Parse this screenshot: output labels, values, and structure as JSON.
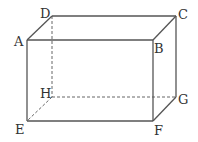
{
  "figure": {
    "type": "rectangular-prism",
    "line_color": "#555555",
    "vertices": [
      {
        "id": "A",
        "label": "A",
        "x": 27,
        "y": 40,
        "lx": 14,
        "ly": 46
      },
      {
        "id": "B",
        "label": "B",
        "x": 153,
        "y": 40,
        "lx": 154,
        "ly": 53
      },
      {
        "id": "C",
        "label": "C",
        "x": 176,
        "y": 16,
        "lx": 178,
        "ly": 19
      },
      {
        "id": "D",
        "label": "D",
        "x": 52,
        "y": 16,
        "lx": 40,
        "ly": 18
      },
      {
        "id": "E",
        "label": "E",
        "x": 27,
        "y": 121,
        "lx": 15,
        "ly": 134
      },
      {
        "id": "F",
        "label": "F",
        "x": 153,
        "y": 121,
        "lx": 154,
        "ly": 135
      },
      {
        "id": "G",
        "label": "G",
        "x": 176,
        "y": 97,
        "lx": 178,
        "ly": 104
      },
      {
        "id": "H",
        "label": "H",
        "x": 52,
        "y": 97,
        "lx": 40,
        "ly": 98
      }
    ],
    "solid_edges": [
      [
        "A",
        "B"
      ],
      [
        "B",
        "C"
      ],
      [
        "C",
        "D"
      ],
      [
        "D",
        "A"
      ],
      [
        "A",
        "E"
      ],
      [
        "B",
        "F"
      ],
      [
        "C",
        "G"
      ],
      [
        "E",
        "F"
      ],
      [
        "F",
        "G"
      ]
    ],
    "dashed_edges": [
      [
        "D",
        "H"
      ],
      [
        "H",
        "E"
      ],
      [
        "H",
        "G"
      ]
    ]
  }
}
